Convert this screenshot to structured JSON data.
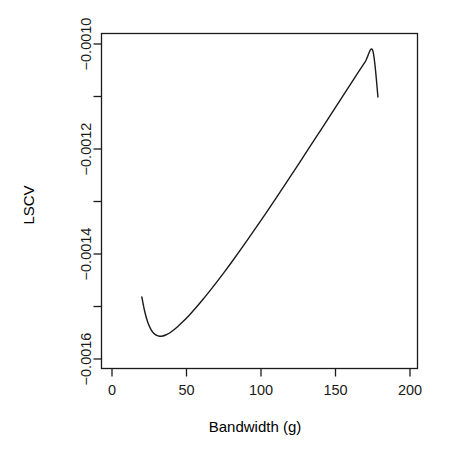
{
  "chart_data": {
    "type": "line",
    "title": "",
    "subtitle": "",
    "xlabel": "Bandwidth (g)",
    "ylabel": "LSCV",
    "xlim": [
      -8,
      208
    ],
    "ylim": [
      -0.00166,
      -0.00094
    ],
    "grid": false,
    "legend": null,
    "xticks": [
      0,
      50,
      100,
      150,
      200
    ],
    "xtick_labels": [
      "0",
      "50",
      "100",
      "150",
      "200"
    ],
    "yticks": [
      -0.001,
      -0.0012,
      -0.0014,
      -0.0016
    ],
    "ytick_labels": [
      "-0.0010",
      "-0.0012",
      "-0.0014",
      "-0.0016"
    ],
    "yminor_ticks": [
      -0.0011,
      -0.0013,
      -0.0015
    ],
    "line_color": "#1a1a1a",
    "line_width": 1.4,
    "box_color": "#1a1a1a",
    "series": [
      {
        "name": "LSCV",
        "x": [
          20.0,
          22.0,
          24.0,
          26.0,
          28.0,
          30.0,
          32.0,
          34.0,
          36.0,
          38.0,
          40.0,
          44.0,
          48.0,
          52.0,
          56.0,
          60.0,
          65.0,
          70.0,
          75.0,
          80.0,
          85.0,
          90.0,
          95.0,
          100.0,
          105.0,
          110.0,
          115.0,
          120.0,
          125.0,
          130.0,
          135.0,
          140.0,
          145.0,
          150.0,
          155.0,
          160.0,
          165.0,
          170.0,
          175.0,
          178.5
        ],
        "y": [
          -0.0014819,
          -0.00151,
          -0.00153,
          -0.001543,
          -0.001551,
          -0.0015552,
          -0.0015567,
          -0.0015562,
          -0.0015543,
          -0.0015514,
          -0.0015477,
          -0.0015385,
          -0.0015278,
          -0.001516,
          -0.0015033,
          -0.00149,
          -0.0014726,
          -0.0014545,
          -0.0014358,
          -0.0014166,
          -0.001397,
          -0.001377,
          -0.0013566,
          -0.001336,
          -0.0013151,
          -0.001294,
          -0.0012727,
          -0.0012512,
          -0.0012296,
          -0.0012079,
          -0.0011861,
          -0.0011643,
          -0.0011424,
          -0.0011205,
          -0.0010986,
          -0.0010768,
          -0.0010551,
          -0.0010336,
          -0.0010123,
          -0.001101
        ]
      }
    ],
    "annotations": [
      {
        "name": "curve-start",
        "x": 20.0,
        "y": -0.0014819
      },
      {
        "name": "curve-minimum",
        "x": 35.5,
        "y": -0.0015567
      },
      {
        "name": "curve-end",
        "x": 178.5,
        "y": -0.001101
      }
    ]
  },
  "plot": {
    "x_axis_title": "Bandwidth (g)",
    "y_axis_title": "LSCV"
  }
}
